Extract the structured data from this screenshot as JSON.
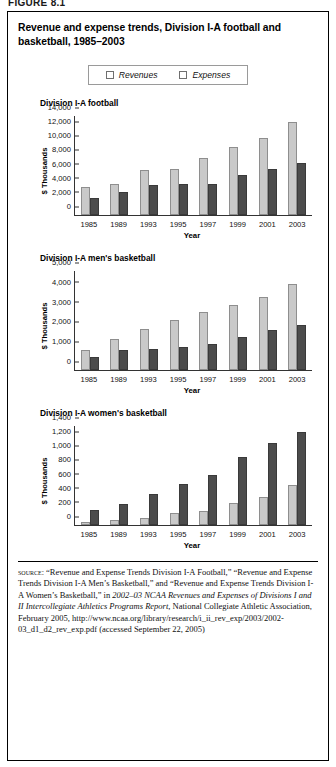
{
  "figure_header": "FIGURE 8.1",
  "title": "Revenue and expense trends, Division I-A football and basketball, 1985–2003",
  "legend": {
    "items": [
      {
        "label": "Revenues",
        "color": "#c9c9c9"
      },
      {
        "label": "Expenses",
        "color": "#4c4c4c"
      }
    ]
  },
  "axis": {
    "ylabel": "$ Thousands",
    "xlabel": "Year"
  },
  "panels": [
    {
      "title": "Division I-A football"
    },
    {
      "title": "Division I-A men's basketball"
    },
    {
      "title": "Division I-A women's basketball"
    }
  ],
  "source": {
    "label": "source:",
    "line1": "“Revenue and Expense Trends Division I-A Football,” “Revenue and Expense Trends Division I-A Men’s Basketball,” and “Revenue and Expense Trends Division I-A Women’s Basketball,” in ",
    "italic1": "2002–03 NCAA Revenues and Expenses of Divisions I and II Intercollegiate Athletics Programs Report",
    "line2": ", National Collegiate Athletic Association, February 2005, http://www.ncaa.org/library/research/i_ii_rev_exp/2003/2002-03_d1_d2_rev_exp.pdf (accessed September 22, 2005)"
  },
  "chart_data": [
    {
      "type": "bar",
      "title": "Division I-A football",
      "xlabel": "Year",
      "ylabel": "$ Thousands",
      "ylim": [
        0,
        14000
      ],
      "yticks": [
        "0",
        "2,000",
        "4,000",
        "6,000",
        "8,000",
        "10,000",
        "12,000",
        "14,000"
      ],
      "ytick_values": [
        0,
        2000,
        4000,
        6000,
        8000,
        10000,
        12000,
        14000
      ],
      "categories": [
        "1985",
        "1989",
        "1993",
        "1995",
        "1997",
        "1999",
        "2001",
        "2003"
      ],
      "series": [
        {
          "name": "Revenues",
          "values": [
            3950,
            4350,
            6300,
            6450,
            8050,
            9600,
            10950,
            13150
          ]
        },
        {
          "name": "Expenses",
          "values": [
            2400,
            3250,
            4200,
            4400,
            4450,
            5700,
            6450,
            7400
          ]
        }
      ],
      "grid": false,
      "legend_position": "top"
    },
    {
      "type": "bar",
      "title": "Division I-A men's basketball",
      "xlabel": "Year",
      "ylabel": "$ Thousands",
      "ylim": [
        0,
        5000
      ],
      "yticks": [
        "0",
        "1,000",
        "2,000",
        "3,000",
        "4,000",
        "5,000"
      ],
      "ytick_values": [
        0,
        1000,
        2000,
        3000,
        4000,
        5000
      ],
      "categories": [
        "1985",
        "1989",
        "1993",
        "1995",
        "1997",
        "1999",
        "2001",
        "2003"
      ],
      "series": [
        {
          "name": "Revenues",
          "values": [
            990,
            1570,
            2070,
            2510,
            2940,
            3290,
            3680,
            4330
          ]
        },
        {
          "name": "Expenses",
          "values": [
            660,
            1030,
            1080,
            1170,
            1310,
            1670,
            2030,
            2260
          ]
        }
      ],
      "grid": false,
      "legend_position": "top"
    },
    {
      "type": "bar",
      "title": "Division I-A women's basketball",
      "xlabel": "Year",
      "ylabel": "$ Thousands",
      "ylim": [
        0,
        1400
      ],
      "yticks": [
        "0",
        "200",
        "400",
        "600",
        "800",
        "1,000",
        "1,200",
        "1,400"
      ],
      "ytick_values": [
        0,
        200,
        400,
        600,
        800,
        1000,
        1200,
        1400
      ],
      "categories": [
        "1985",
        "1989",
        "1993",
        "1995",
        "1997",
        "1999",
        "2001",
        "2003"
      ],
      "series": [
        {
          "name": "Revenues",
          "values": [
            45,
            75,
            105,
            165,
            205,
            315,
            395,
            560
          ]
        },
        {
          "name": "Expenses",
          "values": [
            210,
            300,
            445,
            575,
            705,
            955,
            1165,
            1315
          ]
        }
      ],
      "grid": false,
      "legend_position": "top"
    }
  ]
}
